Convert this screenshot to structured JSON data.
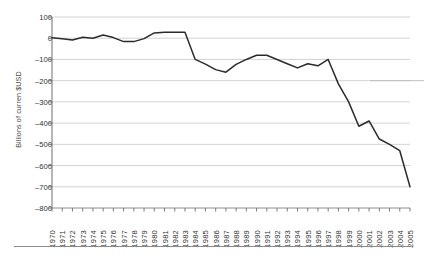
{
  "chart_data": {
    "type": "line",
    "title": "",
    "xlabel": "",
    "ylabel": "Billions of curren $USD",
    "ylim": [
      -800,
      100
    ],
    "ytick_step": 100,
    "grid": true,
    "legend": "none",
    "line_color": "#2b2b2b",
    "grid_color": "#c8c8c8",
    "axis_color": "#6e6e6e",
    "yticks": [
      "100",
      "0",
      "-100",
      "-200",
      "-300",
      "-400",
      "-500",
      "-600",
      "-700",
      "-800"
    ],
    "categories": [
      "1970",
      "1971",
      "1972",
      "1973",
      "1974",
      "1975",
      "1976",
      "1977",
      "1978",
      "1979",
      "1980",
      "1981",
      "1982",
      "1983",
      "1984",
      "1985",
      "1986",
      "1987",
      "1988",
      "1989",
      "1990",
      "1991",
      "1992",
      "1993",
      "1994",
      "1995",
      "1996",
      "1997",
      "1998",
      "1999",
      "2000",
      "2001",
      "2002",
      "2003",
      "2004",
      "2005"
    ],
    "values": [
      2,
      -2,
      -8,
      5,
      0,
      15,
      3,
      -16,
      -16,
      -2,
      25,
      28,
      28,
      28,
      -100,
      -122,
      -148,
      -160,
      -123,
      -100,
      -80,
      -80,
      -100,
      -120,
      -140,
      -120,
      -130,
      -100,
      -215,
      -300,
      -415,
      -390,
      -475,
      -500,
      -530,
      -700
    ],
    "artifact_marks": [
      {
        "name": "faint-horizontal-mark",
        "approx_y_value": -200,
        "x_range": [
          "2004",
          "2005"
        ]
      }
    ]
  },
  "footer": {
    "rule": true
  }
}
